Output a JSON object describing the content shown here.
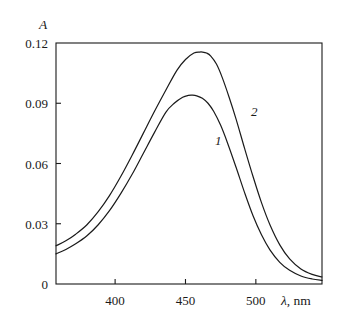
{
  "figure": {
    "kind": "absorption-spectrum",
    "background_color": "#ffffff",
    "line_color": "#1a1a1a"
  },
  "axes": {
    "y_title": "A",
    "x_title_symbol": "λ",
    "x_title_rest": ", nm",
    "x_title_full": "λ, nm",
    "y_tick_labels": [
      "0.12",
      "0.09",
      "0.06",
      "0.03",
      "0"
    ],
    "x_tick_labels": [
      "400",
      "450",
      "500"
    ]
  },
  "curve_labels": {
    "one": "1",
    "two": "2"
  },
  "chart_data": {
    "type": "line",
    "title": "",
    "subtitle": "",
    "xlabel": "λ, nm",
    "ylabel": "A",
    "xlim": [
      358,
      547
    ],
    "ylim": [
      0,
      0.12
    ],
    "xticks": [
      400,
      450,
      500
    ],
    "yticks": [
      0,
      0.03,
      0.06,
      0.09,
      0.12
    ],
    "grid": false,
    "legend": "inline-curve-labels",
    "annotations": [
      {
        "text": "1",
        "x": 473,
        "y": 0.0715,
        "series": "1"
      },
      {
        "text": "2",
        "x": 498,
        "y": 0.0855,
        "series": "2"
      }
    ],
    "series": [
      {
        "name": "1",
        "label": "1",
        "peak_x": 455,
        "peak_y": 0.094,
        "x": [
          358,
          365,
          372,
          380,
          388,
          396,
          404,
          412,
          420,
          428,
          436,
          442,
          448,
          452,
          455,
          458,
          462,
          466,
          470,
          475,
          480,
          486,
          492,
          498,
          504,
          510,
          517,
          524,
          532,
          540,
          547
        ],
        "y": [
          0.015,
          0.0172,
          0.02,
          0.024,
          0.0295,
          0.0365,
          0.045,
          0.0545,
          0.065,
          0.0755,
          0.0855,
          0.09,
          0.093,
          0.0939,
          0.094,
          0.0937,
          0.0925,
          0.09,
          0.086,
          0.079,
          0.07,
          0.058,
          0.0455,
          0.034,
          0.0245,
          0.017,
          0.0108,
          0.0068,
          0.004,
          0.0025,
          0.0018
        ]
      },
      {
        "name": "2",
        "label": "2",
        "peak_x": 462,
        "peak_y": 0.1155,
        "x": [
          358,
          365,
          372,
          380,
          388,
          396,
          404,
          412,
          420,
          428,
          436,
          444,
          450,
          456,
          460,
          462,
          465,
          468,
          472,
          476,
          481,
          486,
          492,
          498,
          504,
          510,
          517,
          524,
          532,
          540,
          547
        ],
        "y": [
          0.019,
          0.0215,
          0.0248,
          0.0295,
          0.036,
          0.044,
          0.0535,
          0.064,
          0.075,
          0.086,
          0.0965,
          0.1065,
          0.1118,
          0.115,
          0.1155,
          0.1155,
          0.115,
          0.1135,
          0.1095,
          0.103,
          0.093,
          0.082,
          0.0675,
          0.0535,
          0.0405,
          0.0295,
          0.0195,
          0.0125,
          0.0075,
          0.0048,
          0.0035
        ]
      }
    ]
  }
}
